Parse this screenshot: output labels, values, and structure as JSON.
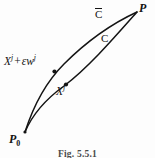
{
  "figure": {
    "caption": "Fig. 5.5.1",
    "background_color": "#fdfdfd",
    "ink_color": "#141414",
    "width": 155,
    "height": 158
  },
  "labels": {
    "varied_point": {
      "base": "X",
      "base_sup": "j",
      "operator": "+",
      "variation": "εw",
      "variation_sup": "j",
      "full_text": "Xʲ + εwʲ"
    },
    "base_point": {
      "base": "X",
      "base_sup": "j",
      "full_text": "Xʲ"
    },
    "varied_curve": {
      "text": "C",
      "accent": "overbar",
      "full_text": "C̄"
    },
    "base_curve": {
      "text": "C"
    },
    "end_point": {
      "text": "P"
    },
    "start_point": {
      "base": "P",
      "sub": "0",
      "full_text": "P₀"
    }
  },
  "chart_data": {
    "type": "line",
    "title": "Fig. 5.5.1",
    "xlabel": "",
    "ylabel": "",
    "grid": false,
    "legend": "none",
    "xlim": [
      0,
      155
    ],
    "ylim": [
      158,
      0
    ],
    "annotations": [
      {
        "name": "start-vertex",
        "text": "P₀",
        "x": 25,
        "y": 132
      },
      {
        "name": "end-vertex",
        "text": "P",
        "x": 137,
        "y": 12
      },
      {
        "name": "varied-curve-label",
        "text": "C̄",
        "x": 100,
        "y": 14
      },
      {
        "name": "base-curve-label",
        "text": "C",
        "x": 104,
        "y": 39
      },
      {
        "name": "varied-point-label",
        "text": "Xʲ + εwʲ",
        "x": 30,
        "y": 60
      },
      {
        "name": "base-point-label",
        "text": "Xʲ",
        "x": 63,
        "y": 90
      }
    ],
    "series": [
      {
        "name": "C̄",
        "description": "varied path (upper curve) from P0 to P",
        "path": "M 25 132 C 34 104, 46 82, 64 64 C 84 44, 111 24, 137 12",
        "marker": {
          "x": 54.5,
          "y": 71.5,
          "label": "Xʲ + εwʲ"
        },
        "x": [
          25,
          34,
          46,
          55,
          64,
          84,
          111,
          137
        ],
        "y": [
          132,
          104,
          82,
          71,
          64,
          44,
          24,
          12
        ]
      },
      {
        "name": "C",
        "description": "base path (lower curve) from P0 to P",
        "path": "M 25 132 C 33 113, 46 99, 64 86 C 88 68, 114 38, 137 12",
        "marker": {
          "x": 66.0,
          "y": 84.5,
          "label": "Xʲ"
        },
        "x": [
          25,
          33,
          46,
          56,
          66,
          88,
          114,
          137
        ],
        "y": [
          132,
          113,
          99,
          92,
          85,
          68,
          38,
          12
        ]
      }
    ]
  }
}
